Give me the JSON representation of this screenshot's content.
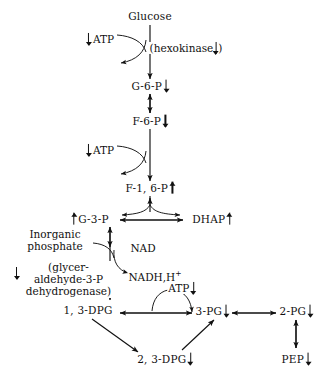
{
  "diagram": {
    "type": "pathway-diagram",
    "stroke_color": "#111111",
    "background_color": "#ffffff"
  },
  "nodes": {
    "glucose": {
      "label": "Glucose",
      "trend": "none",
      "x": 150,
      "y": 17
    },
    "g6p": {
      "label": "G-6-P",
      "trend": "down",
      "x": 148,
      "y": 86
    },
    "f6p": {
      "label": "F-6-P",
      "trend": "down",
      "x": 148,
      "y": 121
    },
    "f16p": {
      "label": "F-1, 6-P",
      "trend": "up",
      "x": 148,
      "y": 188
    },
    "g3p": {
      "label": "G-3-P",
      "trend": "up_before",
      "x": 88,
      "y": 218
    },
    "dhap": {
      "label": "DHAP",
      "trend": "up",
      "x": 212,
      "y": 218
    },
    "dpg13": {
      "label": "1, 3-DPG",
      "trend": "none",
      "x": 88,
      "y": 310
    },
    "pg3": {
      "label": "3-PG",
      "trend": "down",
      "x": 212,
      "y": 310
    },
    "pg2": {
      "label": "2-PG",
      "trend": "down",
      "x": 296,
      "y": 310
    },
    "dpg23": {
      "label": "2, 3-DPG",
      "trend": "down",
      "x": 165,
      "y": 358
    },
    "pep": {
      "label": "PEP",
      "trend": "down",
      "x": 296,
      "y": 358
    }
  },
  "cofactors": {
    "atp_hexokinase": {
      "label": "ATP",
      "trend": "down_before",
      "x": 100,
      "y": 39
    },
    "hexokinase": {
      "label": "(hexokinase",
      "suffix": ")",
      "trend": "down",
      "x": 183,
      "y": 48
    },
    "atp_pfk": {
      "label": "ATP",
      "trend": "down_before",
      "x": 100,
      "y": 150
    },
    "inorganic_phosphate": {
      "line1": "Inorganic",
      "line2": "phosphate",
      "trend": "none",
      "x": 55,
      "y": 240
    },
    "nad": {
      "label": "NAD",
      "trend": "none",
      "x": 143,
      "y": 248
    },
    "nadh": {
      "label": "NADH,H",
      "superscript": "+",
      "trend": "none",
      "x": 152,
      "y": 277
    },
    "gapdh": {
      "line1": "(glycer-",
      "line2": "aldehyde-3-P",
      "line3": "dehydrogenase)",
      "trend": "down_before",
      "x": 58,
      "y": 277
    },
    "atp_pgk": {
      "label": "ATP",
      "trend": "down",
      "x": 180,
      "y": 288
    }
  },
  "legend": {
    "down_symbol": "decreased",
    "up_symbol": "increased"
  }
}
